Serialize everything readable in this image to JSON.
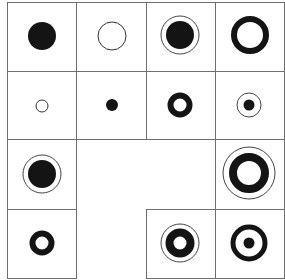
{
  "puzzle": {
    "grid": {
      "rows": 4,
      "cols": 4,
      "x": [
        7,
        76,
        146,
        215,
        284
      ],
      "y": [
        2,
        71,
        139,
        209,
        278
      ],
      "line_color": "#6e6e6e"
    },
    "cells": [
      {
        "row": 0,
        "col": 0,
        "figure": "large-solid-disc"
      },
      {
        "row": 0,
        "col": 1,
        "figure": "large-thin-ring"
      },
      {
        "row": 0,
        "col": 2,
        "figure": "solid-disc-with-outer-thin-ring"
      },
      {
        "row": 0,
        "col": 3,
        "figure": "thick-ring"
      },
      {
        "row": 1,
        "col": 0,
        "figure": "small-thin-ring"
      },
      {
        "row": 1,
        "col": 1,
        "figure": "small-solid-disc"
      },
      {
        "row": 1,
        "col": 2,
        "figure": "small-thick-ring"
      },
      {
        "row": 1,
        "col": 3,
        "figure": "small-dot-with-thin-ring"
      },
      {
        "row": 2,
        "col": 0,
        "figure": "solid-disc-with-outer-thin-ring"
      },
      {
        "row": 2,
        "col": 3,
        "figure": "thick-ring-with-outer-thin-ring"
      },
      {
        "row": 3,
        "col": 0,
        "figure": "small-thick-ring"
      },
      {
        "row": 3,
        "col": 2,
        "figure": "thick-ring-with-outer-thin-ring"
      },
      {
        "row": 3,
        "col": 3,
        "figure": "thick-ring-with-center-dot"
      }
    ],
    "empty_cells": [
      {
        "row": 2,
        "col": 1
      },
      {
        "row": 2,
        "col": 2
      }
    ],
    "colors": {
      "ink": "#141414",
      "paper": "#ffffff"
    }
  }
}
